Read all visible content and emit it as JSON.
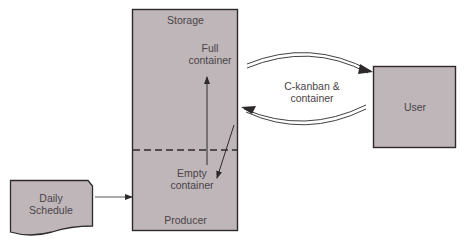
{
  "diagram": {
    "storage_box": {
      "top_label": "Storage",
      "bottom_label": "Producer",
      "full_container_line1": "Full",
      "full_container_line2": "container",
      "empty_container_line1": "Empty",
      "empty_container_line2": "container"
    },
    "user_box": {
      "label": "User"
    },
    "daily_schedule": {
      "line1": "Daily",
      "line2": "Schedule"
    },
    "flow_label": {
      "line1": "C-kanban &",
      "line2": "container"
    },
    "colors": {
      "box_fill": "#bfb6ba",
      "box_stroke": "#2e2a2c",
      "text": "#4a4446",
      "arrow": "#2e2a2c"
    }
  }
}
